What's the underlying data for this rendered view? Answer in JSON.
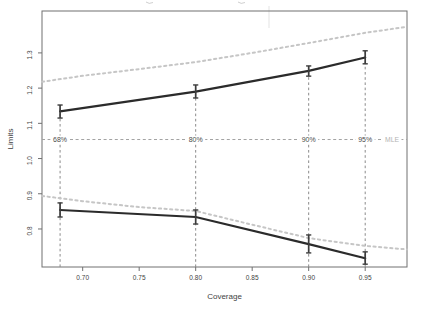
{
  "chart_data": {
    "type": "line",
    "title": "",
    "xlabel": "Coverage",
    "ylabel": "Limits",
    "x_ticks": [
      0.7,
      0.75,
      0.8,
      0.85,
      0.9,
      0.95
    ],
    "y_ticks": [
      0.8,
      0.9,
      1.0,
      1.1,
      1.2,
      1.3
    ],
    "xlim": [
      0.664,
      0.987
    ],
    "ylim": [
      0.692,
      1.419
    ],
    "grid": false,
    "legend": "none",
    "coverages": [
      0.68,
      0.8,
      0.9,
      0.95
    ],
    "coverage_labels": [
      "68%",
      "80%",
      "90%",
      "95%"
    ],
    "mle_value": 1.054,
    "mle_label": "MLE",
    "series": [
      {
        "name": "upper-limit",
        "style": "solid",
        "x": [
          0.68,
          0.8,
          0.9,
          0.95
        ],
        "y": [
          1.134,
          1.19,
          1.249,
          1.287
        ],
        "error_low": [
          1.115,
          1.172,
          1.234,
          1.269
        ],
        "error_high": [
          1.152,
          1.209,
          1.263,
          1.306
        ]
      },
      {
        "name": "lower-limit",
        "style": "solid",
        "x": [
          0.68,
          0.8,
          0.9,
          0.95
        ],
        "y": [
          0.854,
          0.834,
          0.757,
          0.717
        ],
        "error_low": [
          0.834,
          0.814,
          0.732,
          0.7
        ],
        "error_high": [
          0.874,
          0.854,
          0.783,
          0.735
        ]
      },
      {
        "name": "upper-limit-approx",
        "style": "dotted",
        "x": [
          0.664,
          0.7,
          0.75,
          0.8,
          0.85,
          0.9,
          0.95,
          0.987
        ],
        "y": [
          1.218,
          1.235,
          1.254,
          1.274,
          1.3,
          1.328,
          1.357,
          1.374
        ]
      },
      {
        "name": "lower-limit-approx",
        "style": "dotted",
        "x": [
          0.664,
          0.7,
          0.75,
          0.8,
          0.85,
          0.9,
          0.95,
          0.987
        ],
        "y": [
          0.894,
          0.879,
          0.862,
          0.851,
          0.812,
          0.774,
          0.752,
          0.742
        ]
      }
    ],
    "colors": {
      "solid": "#2b2b2b",
      "errbar": "#3c3c3c",
      "dotted": "#c6c6c6",
      "mle_line": "#a2a2a2",
      "mle_text": "#b3b3b3",
      "vline": "#8a8a8a",
      "box": "#707070",
      "tick_text": "#3f3f3f",
      "pct_text": "#4a4a4a",
      "background": "#ffffff"
    }
  }
}
